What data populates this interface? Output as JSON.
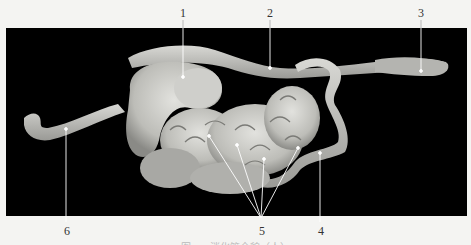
{
  "figure": {
    "background_color": "#f4f4f2",
    "panel_color": "#000000",
    "specimen_color": "#c8c8c4",
    "callouts": [
      {
        "label": "1",
        "label_x": 183,
        "label_y": 8,
        "points": [
          [
            183,
            28
          ],
          [
            183,
            77
          ]
        ]
      },
      {
        "label": "2",
        "label_x": 270,
        "label_y": 8,
        "points": [
          [
            270,
            28
          ],
          [
            270,
            68
          ]
        ]
      },
      {
        "label": "3",
        "label_x": 421,
        "label_y": 8,
        "points": [
          [
            421,
            28
          ],
          [
            421,
            71
          ]
        ]
      },
      {
        "label": "4",
        "label_x": 320,
        "label_y": 227,
        "points": [
          [
            320,
            216
          ],
          [
            320,
            153
          ]
        ]
      },
      {
        "label": "5",
        "label_x": 261,
        "label_y": 227,
        "points": [
          [
            261,
            216
          ],
          [
            209,
            136
          ]
        ],
        "extra": [
          [
            [
              261,
              216
            ],
            [
              237,
              145
            ]
          ],
          [
            [
              261,
              216
            ],
            [
              264,
              159
            ]
          ],
          [
            [
              261,
              216
            ],
            [
              298,
              148
            ]
          ]
        ]
      },
      {
        "label": "6",
        "label_x": 66,
        "label_y": 227,
        "points": [
          [
            66,
            216
          ],
          [
            66,
            129
          ]
        ]
      }
    ],
    "labels": {
      "l1": "1",
      "l2": "2",
      "l3": "3",
      "l4": "4",
      "l5": "5",
      "l6": "6"
    },
    "caption": "图 · · · 消化管全貌（人）"
  }
}
